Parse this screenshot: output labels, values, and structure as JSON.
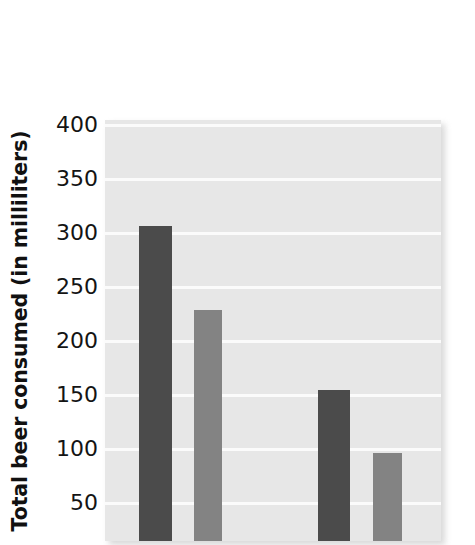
{
  "chart_data": {
    "type": "bar",
    "title": "",
    "subtitle": "",
    "xlabel": "",
    "ylabel": "Total beer consumed (in milliliters)",
    "categories": [
      "",
      "",
      "",
      ""
    ],
    "values": [
      306,
      228,
      154,
      95
    ],
    "bar_colors": [
      "#4b4b4b",
      "#838383",
      "#4b4b4b",
      "#838383"
    ],
    "ylim": [
      0,
      400
    ],
    "ytick_labels": [
      "400",
      "350",
      "300",
      "250",
      "200",
      "150",
      "100",
      "50"
    ],
    "ytick_values": [
      400,
      350,
      300,
      250,
      200,
      150,
      100,
      50
    ],
    "grid": true,
    "grid_color": "#fbfbfb",
    "legend": "none",
    "plot_background": "#e7e7e7",
    "figure_background": "#ffffff",
    "note": "Chart is cropped at the bottom; x-axis line and category labels are not visible."
  },
  "axis": {
    "y_title": "Total beer consumed (in milliliters)"
  }
}
